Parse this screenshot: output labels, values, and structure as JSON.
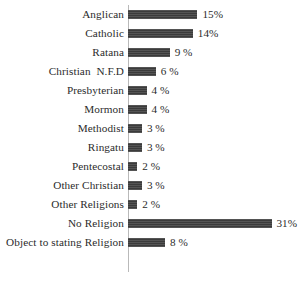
{
  "chart_data": {
    "type": "bar",
    "orientation": "horizontal",
    "title": "",
    "subtitle": "",
    "xlabel": "",
    "ylabel": "",
    "xlim": [
      0,
      31
    ],
    "grid": false,
    "legend": null,
    "bar_color": "#3b3b3b",
    "axis_color": "#b9b9b9",
    "background_color": "#ffffff",
    "categories": [
      "Anglican",
      "Catholic",
      "Ratana",
      "Christian  N.F.D",
      "Presbyterian",
      "Mormon",
      "Methodist",
      "Ringatu",
      "Pentecostal",
      "Other Christian",
      "Other Religions",
      "No Religion",
      "Object to stating Religion"
    ],
    "values": [
      15,
      14,
      9,
      6,
      4,
      4,
      3,
      3,
      2,
      3,
      2,
      31,
      8
    ],
    "data_labels": [
      "15%",
      "14%",
      "9 %",
      "6 %",
      "4 %",
      "4 %",
      "3 %",
      "3 %",
      "2 %",
      "3 %",
      "2 %",
      "31%",
      "8 %"
    ],
    "rows": [
      {
        "category": "Anglican",
        "value": 15,
        "label": "15%"
      },
      {
        "category": "Catholic",
        "value": 14,
        "label": "14%"
      },
      {
        "category": "Ratana",
        "value": 9,
        "label": "9 %"
      },
      {
        "category": "Christian  N.F.D",
        "value": 6,
        "label": "6 %"
      },
      {
        "category": "Presbyterian",
        "value": 4,
        "label": "4 %"
      },
      {
        "category": "Mormon",
        "value": 4,
        "label": "4 %"
      },
      {
        "category": "Methodist",
        "value": 3,
        "label": "3 %"
      },
      {
        "category": "Ringatu",
        "value": 3,
        "label": "3 %"
      },
      {
        "category": "Pentecostal",
        "value": 2,
        "label": "2 %"
      },
      {
        "category": "Other Christian",
        "value": 3,
        "label": "3 %"
      },
      {
        "category": "Other Religions",
        "value": 2,
        "label": "2 %"
      },
      {
        "category": "No Religion",
        "value": 31,
        "label": "31%"
      },
      {
        "category": "Object to stating Religion",
        "value": 8,
        "label": "8 %"
      }
    ],
    "px_per_unit": 4.63
  }
}
